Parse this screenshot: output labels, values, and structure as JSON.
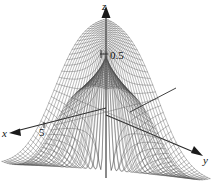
{
  "figure": {
    "background_color": "#ffffff",
    "ink_color": "#1a1a1a",
    "mesh_color": "#555555",
    "width": 214,
    "height": 188
  },
  "axes": {
    "z": {
      "label": "z",
      "arrow": "up",
      "tick_label": "0.5",
      "tick_value": 0.5
    },
    "x": {
      "label": "x",
      "arrow": "down-left",
      "tick_label": "5",
      "tick_value": 5
    },
    "y": {
      "label": "y",
      "arrow": "down-right",
      "tick_label": "",
      "tick_value": null
    }
  },
  "chart_data": {
    "type": "line",
    "subtype": "3d-wireframe-surface",
    "title": "",
    "subtitle": "",
    "xlabel": "x",
    "ylabel": "y",
    "zlabel": "z",
    "grid": false,
    "legend": null,
    "annotations": [],
    "projection": "3d-axonometric",
    "axis_ticks": {
      "x": [
        "5"
      ],
      "y": [],
      "z": [
        "0.5"
      ]
    },
    "zlim": [
      -0.5,
      0.5
    ],
    "surface": {
      "mesh_lines_u": 40,
      "mesh_lines_v": 40,
      "shading": "hidden-line wireframe"
    }
  }
}
